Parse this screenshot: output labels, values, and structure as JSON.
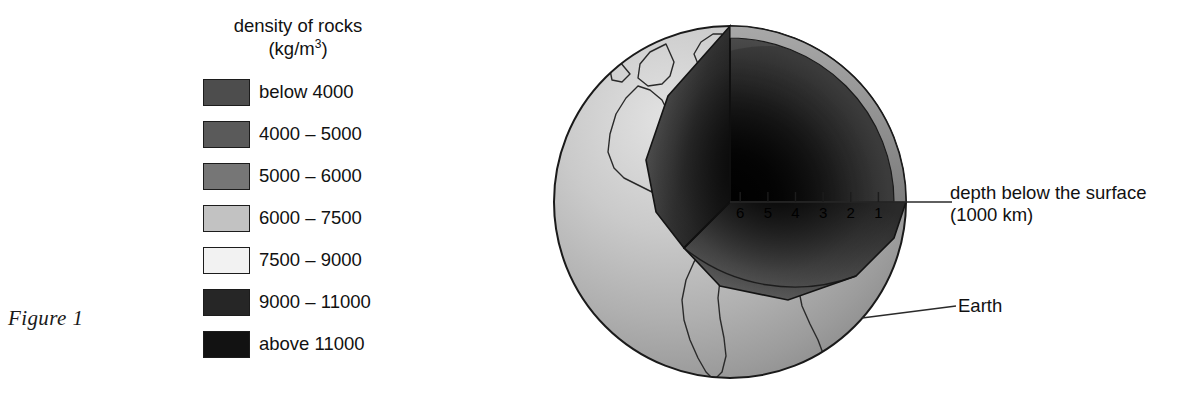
{
  "figure": {
    "caption": "Figure 1"
  },
  "legend": {
    "title_line1": "density of rocks",
    "title_line2_prefix": "(kg/m",
    "title_line2_sup": "3",
    "title_line2_suffix": ")",
    "items": [
      {
        "label": "below 4000",
        "color": "#4d4d4d"
      },
      {
        "label": "4000 – 5000",
        "color": "#5a5a5a"
      },
      {
        "label": "5000 – 6000",
        "color": "#767676"
      },
      {
        "label": "6000 – 7500",
        "color": "#c2c2c2"
      },
      {
        "label": "7500 – 9000",
        "color": "#f2f2f2"
      },
      {
        "label": "9000 – 11000",
        "color": "#262626"
      },
      {
        "label": "above 11000",
        "color": "#121212"
      }
    ]
  },
  "diagram": {
    "depth_label_line1": "depth below the surface",
    "depth_label_line2": "(1000 km)",
    "earth_label": "Earth",
    "scale_ticks": [
      {
        "label": "6",
        "value": 6
      },
      {
        "label": "5",
        "value": 5
      },
      {
        "label": "4",
        "value": 4
      },
      {
        "label": "3",
        "value": 3
      },
      {
        "label": "2",
        "value": 2
      },
      {
        "label": "1",
        "value": 1
      }
    ],
    "globe": {
      "center_x": 730,
      "center_y": 202,
      "radius": 176
    },
    "surface_color": "#b8b8b8",
    "outline_color": "#1a1a1a"
  }
}
